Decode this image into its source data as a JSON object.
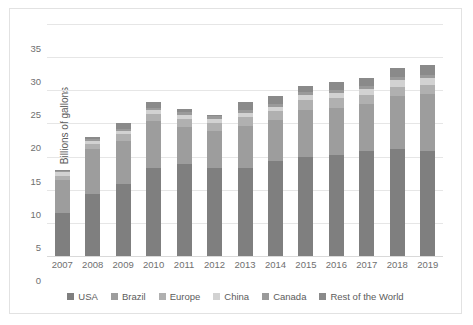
{
  "chart_data": {
    "type": "bar",
    "stacked": true,
    "title": "",
    "xlabel": "",
    "ylabel": "Billions of gallons",
    "ylim": [
      0,
      35
    ],
    "yticks": [
      0,
      5,
      10,
      15,
      20,
      25,
      30,
      35
    ],
    "grid": true,
    "legend_position": "bottom",
    "categories": [
      "2007",
      "2008",
      "2009",
      "2010",
      "2011",
      "2012",
      "2013",
      "2014",
      "2015",
      "2016",
      "2017",
      "2018",
      "2019"
    ],
    "series": [
      {
        "name": "USA",
        "color": "#7f7f7f",
        "values": [
          6.5,
          9.3,
          10.8,
          13.3,
          13.9,
          13.3,
          13.3,
          14.3,
          15.0,
          15.3,
          15.8,
          16.1,
          15.8
        ]
      },
      {
        "name": "Brazil",
        "color": "#9d9d9d",
        "values": [
          5.0,
          6.9,
          6.6,
          7.0,
          5.6,
          5.6,
          6.3,
          6.2,
          7.1,
          7.1,
          7.1,
          8.0,
          8.6
        ]
      },
      {
        "name": "Europe",
        "color": "#b0b0b0",
        "values": [
          0.6,
          0.7,
          1.0,
          1.2,
          1.2,
          1.2,
          1.4,
          1.4,
          1.4,
          1.4,
          1.4,
          1.4,
          1.4
        ]
      },
      {
        "name": "China",
        "color": "#d2d2d2",
        "values": [
          0.5,
          0.5,
          0.5,
          0.5,
          0.6,
          0.6,
          0.6,
          0.6,
          0.8,
          0.8,
          0.9,
          1.0,
          1.0
        ]
      },
      {
        "name": "Canada",
        "color": "#9a9a9a",
        "values": [
          0.2,
          0.2,
          0.3,
          0.3,
          0.4,
          0.4,
          0.5,
          0.5,
          0.5,
          0.5,
          0.5,
          0.5,
          0.5
        ]
      },
      {
        "name": "Rest of the World",
        "color": "#8a8a8a",
        "values": [
          0.2,
          0.4,
          0.8,
          0.9,
          0.5,
          0.1,
          1.1,
          1.2,
          0.9,
          1.1,
          1.1,
          1.3,
          1.5
        ]
      }
    ],
    "totals": [
      13.0,
      18.0,
      20.0,
      23.2,
      22.2,
      21.2,
      23.2,
      24.2,
      25.7,
      26.2,
      26.8,
      28.3,
      28.8
    ]
  },
  "legend": {
    "items": [
      {
        "label": "USA"
      },
      {
        "label": "Brazil"
      },
      {
        "label": "Europe"
      },
      {
        "label": "China"
      },
      {
        "label": "Canada"
      },
      {
        "label": "Rest of the World"
      }
    ]
  },
  "watermark": {
    "text": ""
  }
}
